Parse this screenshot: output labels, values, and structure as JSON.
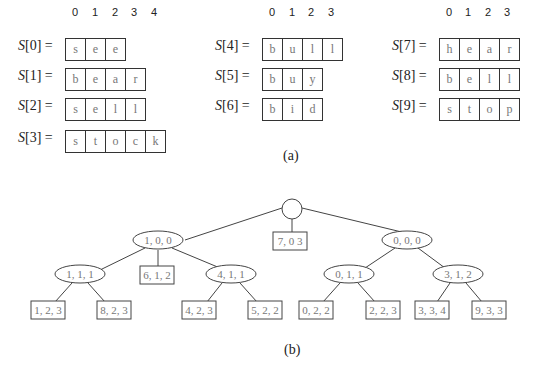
{
  "part_a": {
    "caption": "(a)",
    "index_labels": [
      "0",
      "1",
      "2",
      "3",
      "4"
    ],
    "strings": [
      {
        "name": "S",
        "index": "0",
        "label": "S[0] =",
        "chars": [
          "s",
          "e",
          "e"
        ]
      },
      {
        "name": "S",
        "index": "1",
        "label": "S[1] =",
        "chars": [
          "b",
          "e",
          "a",
          "r"
        ]
      },
      {
        "name": "S",
        "index": "2",
        "label": "S[2] =",
        "chars": [
          "s",
          "e",
          "l",
          "l"
        ]
      },
      {
        "name": "S",
        "index": "3",
        "label": "S[3] =",
        "chars": [
          "s",
          "t",
          "o",
          "c",
          "k"
        ]
      },
      {
        "name": "S",
        "index": "4",
        "label": "S[4] =",
        "chars": [
          "b",
          "u",
          "l",
          "l"
        ]
      },
      {
        "name": "S",
        "index": "5",
        "label": "S[5] =",
        "chars": [
          "b",
          "u",
          "y"
        ]
      },
      {
        "name": "S",
        "index": "6",
        "label": "S[6] =",
        "chars": [
          "b",
          "i",
          "d"
        ]
      },
      {
        "name": "S",
        "index": "7",
        "label": "S[7] =",
        "chars": [
          "h",
          "e",
          "a",
          "r"
        ]
      },
      {
        "name": "S",
        "index": "8",
        "label": "S[8] =",
        "chars": [
          "b",
          "e",
          "l",
          "l"
        ]
      },
      {
        "name": "S",
        "index": "9",
        "label": "S[9] =",
        "chars": [
          "s",
          "t",
          "o",
          "p"
        ]
      }
    ]
  },
  "part_b": {
    "caption": "(b)",
    "root": {
      "label": ""
    },
    "internal_nodes": [
      "1, 0, 0",
      "0, 0, 0",
      "1, 1, 1",
      "4, 1, 1",
      "0, 1, 1",
      "3, 1, 2"
    ],
    "leaves": [
      "7, 0 3",
      "6, 1, 2",
      "1, 2, 3",
      "8, 2, 3",
      "4, 2, 3",
      "5, 2, 2",
      "0, 2, 2",
      "2, 2, 3",
      "3, 3, 4",
      "9, 3, 3"
    ]
  }
}
